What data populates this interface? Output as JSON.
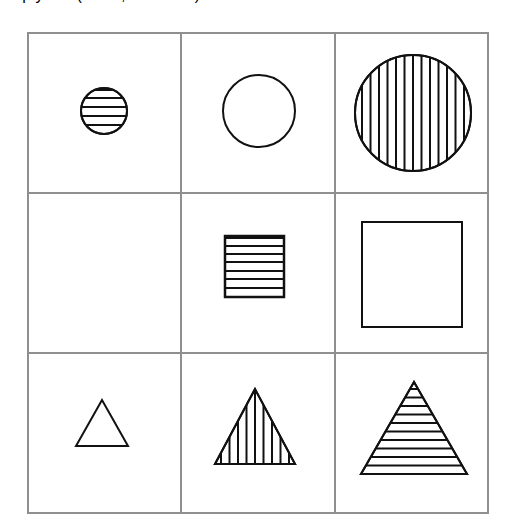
{
  "puzzle": {
    "title": "3x3 shape matrix puzzle",
    "grid": {
      "rows": 3,
      "cols": 3,
      "x_lines": [
        28,
        181,
        335,
        488
      ],
      "y_lines": [
        33,
        193,
        353,
        513
      ],
      "line_color": "#8f8f8f"
    },
    "shape_color": "#111111",
    "cells": [
      {
        "row": 0,
        "col": 0,
        "shape": "circle",
        "size": "small",
        "fill": "horizontal-stripes",
        "cx": 104,
        "cy": 111,
        "r": 23
      },
      {
        "row": 0,
        "col": 1,
        "shape": "circle",
        "size": "medium",
        "fill": "none",
        "cx": 259,
        "cy": 111,
        "r": 36
      },
      {
        "row": 0,
        "col": 2,
        "shape": "circle",
        "size": "large",
        "fill": "vertical-stripes",
        "cx": 413,
        "cy": 113,
        "r": 58
      },
      {
        "row": 1,
        "col": 0,
        "shape": "empty",
        "size": "",
        "fill": ""
      },
      {
        "row": 1,
        "col": 1,
        "shape": "square",
        "size": "small",
        "fill": "horizontal-stripes",
        "x": 225,
        "y": 236,
        "w": 59,
        "h": 61
      },
      {
        "row": 1,
        "col": 2,
        "shape": "square",
        "size": "large",
        "fill": "none",
        "x": 362,
        "y": 222,
        "w": 100,
        "h": 105
      },
      {
        "row": 2,
        "col": 0,
        "shape": "triangle",
        "size": "small",
        "fill": "none",
        "points": [
          [
            102,
            400
          ],
          [
            76,
            446
          ],
          [
            128,
            446
          ]
        ]
      },
      {
        "row": 2,
        "col": 1,
        "shape": "triangle",
        "size": "medium",
        "fill": "vertical-stripes",
        "points": [
          [
            255,
            389
          ],
          [
            215,
            464
          ],
          [
            295,
            464
          ]
        ]
      },
      {
        "row": 2,
        "col": 2,
        "shape": "triangle",
        "size": "large",
        "fill": "horizontal-stripes",
        "points": [
          [
            414,
            382
          ],
          [
            361,
            474
          ],
          [
            467,
            474
          ]
        ]
      }
    ],
    "labels": {
      "missing_cell": "empty cell (row 2, column 1)"
    }
  }
}
